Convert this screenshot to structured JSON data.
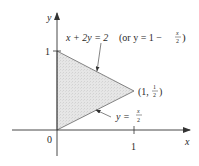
{
  "diagram": {
    "type": "region-plot",
    "axes": {
      "x_label": "x",
      "y_label": "y",
      "origin_label": "0",
      "x_tick_label": "1",
      "y_tick_label": "1"
    },
    "region": {
      "vertices": [
        [
          0,
          0
        ],
        [
          0,
          1
        ],
        [
          1,
          0.5
        ]
      ],
      "fill_color": "#e2e2e2",
      "edge_color": "#555555"
    },
    "annotations": {
      "upper_line": {
        "eq_main": "x + 2y = 2",
        "eq_alt_prefix": "(or y = 1 −",
        "frac_num": "x",
        "frac_den": "2",
        "close": ")"
      },
      "lower_line": {
        "eq_prefix": "y =",
        "frac_num": "x",
        "frac_den": "2"
      },
      "vertex_point": {
        "open": "(1,",
        "frac_num": "1",
        "frac_den": "2",
        "close": ")"
      }
    }
  }
}
